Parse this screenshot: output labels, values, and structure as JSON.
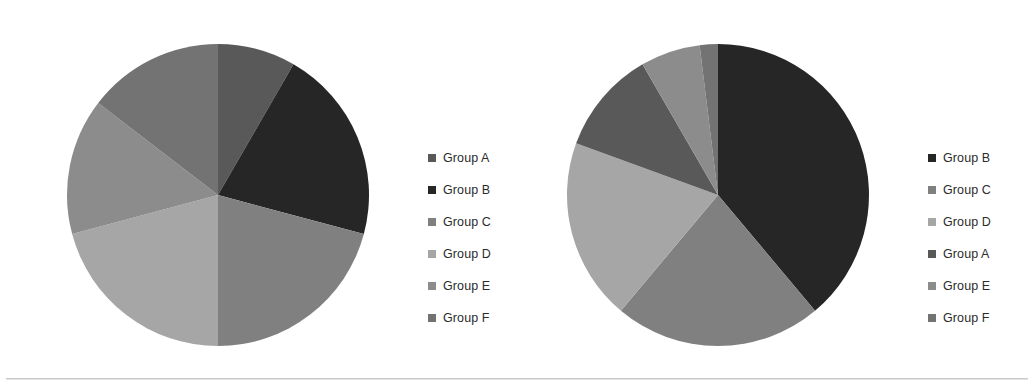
{
  "figure": {
    "title": "",
    "background_color": "#ffffff",
    "divider_color": "#c9c9c9"
  },
  "palette": {
    "group_a": "#595959",
    "group_b": "#262626",
    "group_c": "#808080",
    "group_d": "#a6a6a6",
    "group_e": "#8c8c8c",
    "group_f": "#737373"
  },
  "left_chart": {
    "name": "pie-chart-left",
    "center": {
      "x": 218,
      "y": 195
    },
    "radius": 152,
    "legend": {
      "position": "right",
      "x": 428,
      "y": 142,
      "items": [
        {
          "label": "Group A",
          "color": "#595959"
        },
        {
          "label": "Group B",
          "color": "#262626"
        },
        {
          "label": "Group C",
          "color": "#808080"
        },
        {
          "label": "Group D",
          "color": "#a6a6a6"
        },
        {
          "label": "Group E",
          "color": "#8c8c8c"
        },
        {
          "label": "Group F",
          "color": "#737373"
        }
      ]
    }
  },
  "right_chart": {
    "name": "pie-chart-right",
    "center": {
      "x": 718,
      "y": 195
    },
    "radius": 152,
    "legend": {
      "position": "right",
      "x": 928,
      "y": 142,
      "items": [
        {
          "label": "Group B",
          "color": "#262626"
        },
        {
          "label": "Group C",
          "color": "#808080"
        },
        {
          "label": "Group D",
          "color": "#a6a6a6"
        },
        {
          "label": "Group A",
          "color": "#595959"
        },
        {
          "label": "Group E",
          "color": "#8c8c8c"
        },
        {
          "label": "Group F",
          "color": "#737373"
        }
      ]
    }
  },
  "chart_data": [
    {
      "type": "pie",
      "id": "left",
      "title": "",
      "start_angle_deg": 0,
      "direction": "clockwise",
      "legend_position": "right",
      "labels": [
        "Group A",
        "Group B",
        "Group C",
        "Group D",
        "Group E",
        "Group F"
      ],
      "values": [
        8.3,
        20.8,
        20.8,
        20.8,
        14.6,
        14.7
      ],
      "angles_deg": [
        30,
        75,
        75,
        75,
        52.5,
        52.5
      ],
      "colors": [
        "#595959",
        "#262626",
        "#808080",
        "#a6a6a6",
        "#8c8c8c",
        "#737373"
      ],
      "slice_order_clockwise_from_12": [
        "Group A",
        "Group B",
        "Group C",
        "Group D",
        "Group E",
        "Group F"
      ]
    },
    {
      "type": "pie",
      "id": "right",
      "title": "",
      "start_angle_deg": 0,
      "direction": "clockwise",
      "legend_position": "right",
      "labels": [
        "Group B",
        "Group C",
        "Group D",
        "Group A",
        "Group E",
        "Group F"
      ],
      "values": [
        38.9,
        22.2,
        19.4,
        11.1,
        6.4,
        2.0
      ],
      "angles_deg": [
        140,
        80,
        70,
        40,
        23,
        7
      ],
      "colors": [
        "#262626",
        "#808080",
        "#a6a6a6",
        "#595959",
        "#8c8c8c",
        "#737373"
      ],
      "slice_order_clockwise_from_12": [
        "Group B",
        "Group C",
        "Group D",
        "Group A",
        "Group E",
        "Group F"
      ]
    }
  ]
}
